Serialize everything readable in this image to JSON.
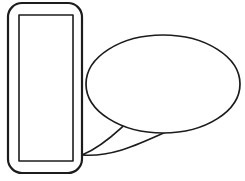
{
  "canvas": {
    "width": 245,
    "height": 181,
    "background_color": "#ffffff",
    "stroke_color": "#1c1c1c",
    "fill_color": "#ffffff",
    "title": "Callout diagram: rounded rectangle with nested rectangle linked to ellipse by a tapered tail"
  },
  "shapes": {
    "outer_rounded_rect": {
      "name": "rounded-rectangle-outer",
      "x": 8,
      "y": 3,
      "width": 74,
      "height": 170,
      "corner_radius": 14,
      "stroke_width": 2.2,
      "fill": "#ffffff",
      "stroke": "#1c1c1c"
    },
    "inner_rect": {
      "name": "rectangle-inner",
      "x": 19,
      "y": 15,
      "width": 54,
      "height": 146,
      "corner_radius": 0,
      "stroke_width": 1.6,
      "fill": "#ffffff",
      "stroke": "#2a2a2a"
    },
    "ellipse": {
      "name": "ellipse-callout-body",
      "center_x": 163,
      "center_y": 84,
      "radius_x": 77,
      "radius_y": 49,
      "stroke_width": 1.7,
      "fill": "#ffffff",
      "stroke": "#1c1c1c"
    },
    "tail": {
      "name": "callout-tail",
      "tip_x": 82,
      "tip_y": 155,
      "upper_anchor_x": 128,
      "upper_anchor_y": 122,
      "lower_anchor_x": 196,
      "lower_anchor_y": 120,
      "stroke_width": 1.7,
      "fill": "#ffffff",
      "stroke": "#1c1c1c"
    }
  },
  "labels": {
    "outer_rect_label": "",
    "inner_rect_label": "",
    "ellipse_label": ""
  }
}
